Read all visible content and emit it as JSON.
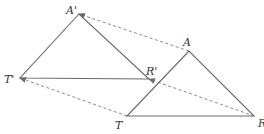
{
  "diagram": {
    "type": "geometric-translation",
    "colors": {
      "solid_line": "#6a6a6a",
      "dashed_line": "#8a8a8a",
      "label": "#333333",
      "background": "#ffffff"
    },
    "original_triangle": {
      "name": "ATR",
      "vertices": [
        {
          "label": "A",
          "x": 189,
          "y": 51,
          "lx": 183,
          "ly": 46
        },
        {
          "label": "T",
          "x": 127,
          "y": 116,
          "lx": 115,
          "ly": 129
        },
        {
          "label": "R",
          "x": 254,
          "y": 116,
          "lx": 258,
          "ly": 127
        }
      ]
    },
    "image_triangle": {
      "name": "A'T'R'",
      "vertices": [
        {
          "label": "A'",
          "x": 79,
          "y": 14,
          "lx": 66,
          "ly": 14
        },
        {
          "label": "T'",
          "x": 20,
          "y": 78,
          "lx": 4,
          "ly": 83
        },
        {
          "label": "R'",
          "x": 149,
          "y": 79,
          "lx": 146,
          "ly": 75
        }
      ]
    },
    "translation_vectors": [
      {
        "from": "A",
        "to": "A'"
      },
      {
        "from": "T",
        "to": "T'"
      },
      {
        "from": "R",
        "to": "R'"
      }
    ]
  }
}
